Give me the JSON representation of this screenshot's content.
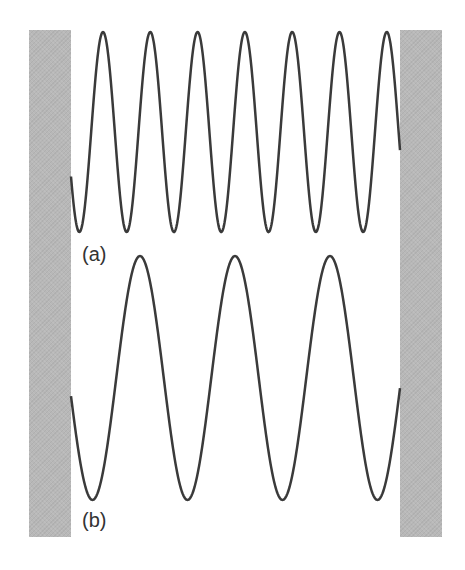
{
  "figure": {
    "walls": {
      "color": "#b8b8b8",
      "left": {
        "x": 29,
        "y": 30,
        "width": 42,
        "height": 507
      },
      "right": {
        "x": 400,
        "y": 30,
        "width": 42,
        "height": 507
      }
    },
    "waves": [
      {
        "id": "a",
        "label": "(a)",
        "x_start": 71,
        "x_end": 400,
        "midline_y": 132,
        "amplitude": 100,
        "period": 47.3,
        "peak_ref_x": 103,
        "stroke": "#3a3a3a",
        "stroke_width": 2.5
      },
      {
        "id": "b",
        "label": "(b)",
        "x_start": 71,
        "x_end": 400,
        "midline_y": 378,
        "amplitude": 122,
        "period": 95,
        "peak_ref_x": 140,
        "stroke": "#3a3a3a",
        "stroke_width": 2.5
      }
    ]
  },
  "labels": {
    "a": "(a)",
    "b": "(b)"
  }
}
